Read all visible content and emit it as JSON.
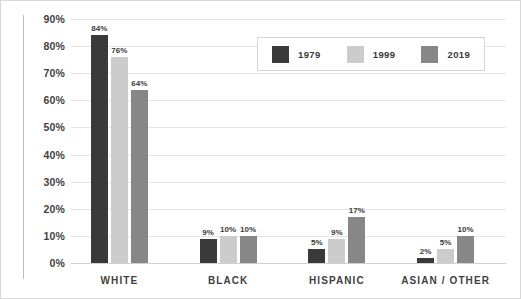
{
  "chart_data": {
    "type": "bar",
    "title": "",
    "xlabel": "",
    "ylabel": "",
    "ylim": [
      0,
      90
    ],
    "ytick_labels": [
      "90%",
      "80%",
      "70%",
      "60%",
      "50%",
      "40%",
      "30%",
      "20%",
      "10%",
      "0%"
    ],
    "ytick_values": [
      90,
      80,
      70,
      60,
      50,
      40,
      30,
      20,
      10,
      0
    ],
    "grid": true,
    "legend_position": "top-right",
    "categories": [
      "WHITE",
      "BLACK",
      "HISPANIC",
      "ASIAN / OTHER"
    ],
    "series": [
      {
        "name": "1979",
        "color": "#3a3a3a",
        "values": [
          84,
          9,
          5,
          2
        ],
        "labels": [
          "84%",
          "9%",
          "5%",
          "2%"
        ]
      },
      {
        "name": "1999",
        "color": "#cccccc",
        "values": [
          76,
          10,
          9,
          5
        ],
        "labels": [
          "76%",
          "10%",
          "9%",
          "5%"
        ]
      },
      {
        "name": "2019",
        "color": "#878787",
        "values": [
          64,
          10,
          17,
          10
        ],
        "labels": [
          "64%",
          "10%",
          "17%",
          "10%"
        ]
      }
    ]
  },
  "legend": {
    "items": [
      {
        "label": "1979",
        "color": "#3a3a3a"
      },
      {
        "label": "1999",
        "color": "#cccccc"
      },
      {
        "label": "2019",
        "color": "#878787"
      }
    ]
  }
}
